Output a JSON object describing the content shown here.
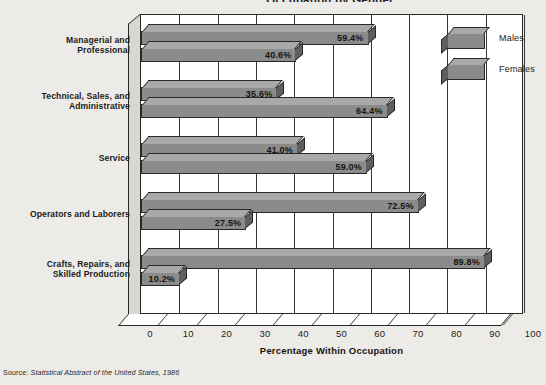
{
  "figure": {
    "title": "Occupation by Gender",
    "source_prefix": "Source:",
    "source_body": "Statistical Abstract of the United States, 1986"
  },
  "legend": {
    "position": "inside-top-right",
    "entries": [
      {
        "label": "Males",
        "swatch": "males-swatch"
      },
      {
        "label": "Females",
        "swatch": "females-swatch"
      }
    ]
  },
  "axis": {
    "x_title": "Percentage Within Occupation",
    "x_ticks": [
      "0",
      "10",
      "20",
      "30",
      "40",
      "50",
      "60",
      "70",
      "80",
      "90",
      "100"
    ]
  },
  "colors": {
    "page_background": "#edebe7",
    "plot_background": "#ffffff",
    "bar_front": "#8b8b8b",
    "bar_top": "#a9a9a9",
    "bar_side": "#5f5f5f",
    "outline": "#2a2825",
    "text": "#1d1b19"
  },
  "chart_data": {
    "type": "bar",
    "orientation": "horizontal",
    "grouped": true,
    "three_d": true,
    "title": "Occupation by Gender",
    "xlabel": "Percentage Within Occupation",
    "ylabel": "",
    "xlim": [
      0,
      100
    ],
    "xticks": [
      0,
      10,
      20,
      30,
      40,
      50,
      60,
      70,
      80,
      90,
      100
    ],
    "grid": "vertical",
    "legend_position": "inside-top-right",
    "categories": [
      "Managerial and Professional",
      "Technical, Sales, and Administrative",
      "Service",
      "Operators and Laborers",
      "Crafts, Repairs, and Skilled Production"
    ],
    "series": [
      {
        "name": "Males",
        "values": [
          59.4,
          35.6,
          41.0,
          72.5,
          89.8
        ]
      },
      {
        "name": "Females",
        "values": [
          40.6,
          64.4,
          59.0,
          27.5,
          10.2
        ]
      }
    ],
    "data_labels": [
      {
        "category": "Managerial and Professional",
        "Males": "59.4%",
        "Females": "40.6%"
      },
      {
        "category": "Technical, Sales, and Administrative",
        "Males": "35.6%",
        "Females": "64.4%"
      },
      {
        "category": "Service",
        "Males": "41.0%",
        "Females": "59.0%"
      },
      {
        "category": "Operators and Laborers",
        "Males": "72.5%",
        "Females": "27.5%"
      },
      {
        "category": "Crafts, Repairs, and Skilled Production",
        "Males": "89.8%",
        "Females": "10.2%"
      }
    ]
  },
  "category_labels": [
    {
      "line1": "Managerial and",
      "line2": "Professional"
    },
    {
      "line1": "Technical, Sales, and",
      "line2": "Administrative"
    },
    {
      "line1": "Service",
      "line2": ""
    },
    {
      "line1": "Operators and Laborers",
      "line2": ""
    },
    {
      "line1": "Crafts, Repairs, and",
      "line2": "Skilled Production"
    }
  ]
}
